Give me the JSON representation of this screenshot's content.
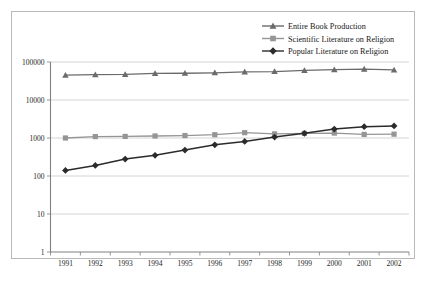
{
  "chart_data": {
    "type": "line",
    "title": "",
    "xlabel": "",
    "ylabel": "",
    "categories": [
      "1991",
      "1992",
      "1993",
      "1994",
      "1995",
      "1996",
      "1997",
      "1998",
      "1999",
      "2000",
      "2001",
      "2002"
    ],
    "yscale": "log",
    "ylim": [
      1,
      100000
    ],
    "yticks": [
      "1",
      "10",
      "100",
      "1000",
      "10000",
      "100000"
    ],
    "ytick_values": [
      1,
      10,
      100,
      1000,
      10000,
      100000
    ],
    "grid": true,
    "legend_position": "top-right",
    "series": [
      {
        "name": "Entire Book Production",
        "color": "#6b6b6b",
        "marker": "triangle",
        "values": [
          45000,
          46500,
          47000,
          50000,
          50500,
          52000,
          55000,
          56000,
          60000,
          63000,
          65000,
          62000
        ]
      },
      {
        "name": "Scientific Literature on Religion",
        "color": "#959595",
        "marker": "square",
        "values": [
          1000,
          1090,
          1100,
          1130,
          1160,
          1220,
          1380,
          1280,
          1320,
          1350,
          1240,
          1260
        ]
      },
      {
        "name": "Popular Literature on Religion",
        "color": "#2b2b2b",
        "marker": "diamond",
        "values": [
          140,
          190,
          280,
          350,
          480,
          660,
          810,
          1060,
          1330,
          1720,
          1980,
          2070
        ]
      }
    ]
  },
  "legend": {
    "items": [
      {
        "label": "Entire Book Production"
      },
      {
        "label": "Scientific Literature on Religion"
      },
      {
        "label": "Popular Literature on Religion"
      }
    ]
  }
}
